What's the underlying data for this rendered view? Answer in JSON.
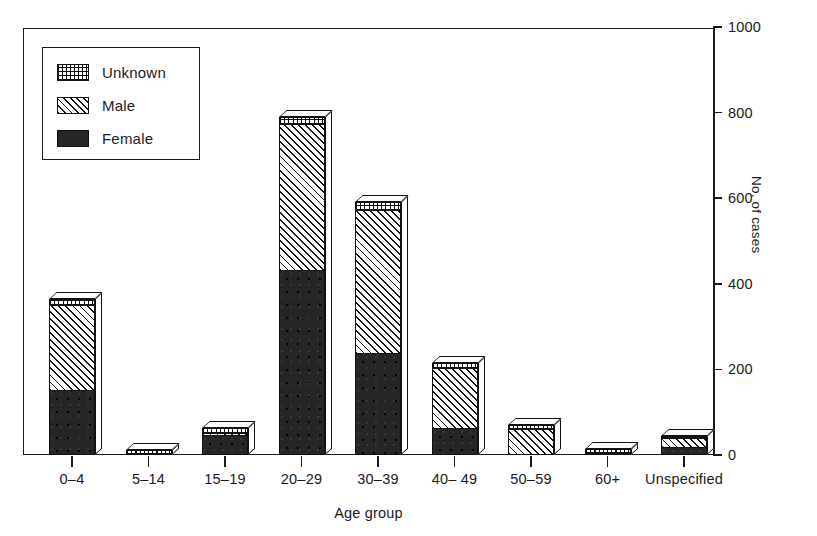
{
  "chart_data": {
    "type": "bar",
    "subtype": "stacked-bar-3d",
    "title": "",
    "xlabel": "Age group",
    "ylabel": "No. of cases",
    "categories": [
      "0–4",
      "5–14",
      "15–19",
      "20–29",
      "30–39",
      "40– 49",
      "50–59",
      "60+",
      "Unspecified"
    ],
    "series": [
      {
        "name": "Female",
        "pattern": "solid-black",
        "values": [
          155,
          2,
          48,
          435,
          240,
          65,
          4,
          2,
          22
        ]
      },
      {
        "name": "Male",
        "pattern": "diagonal-hatch",
        "values": [
          198,
          3,
          5,
          340,
          335,
          140,
          60,
          4,
          20
        ]
      },
      {
        "name": "Unknown",
        "pattern": "dotted-grid",
        "values": [
          12,
          7,
          9,
          15,
          15,
          10,
          6,
          9,
          3
        ]
      }
    ],
    "totals": [
      365,
      12,
      62,
      790,
      590,
      215,
      70,
      15,
      45
    ],
    "ylim": [
      0,
      1000
    ],
    "yticks": [
      0,
      200,
      400,
      600,
      800,
      1000
    ],
    "ytick_labels": [
      "0",
      "200",
      "400",
      "600",
      "800",
      "1000"
    ],
    "y_axis_position": "right",
    "grid": false,
    "legend_position": "top-left",
    "legend_entries": [
      "Unknown",
      "Male",
      "Female"
    ]
  },
  "legend": {
    "items": [
      {
        "label": "Unknown",
        "swatch": "unknown"
      },
      {
        "label": "Male",
        "swatch": "male"
      },
      {
        "label": "Female",
        "swatch": "female"
      }
    ]
  },
  "axes": {
    "y": {
      "title": "No. of cases",
      "ticks": [
        "1000",
        "800",
        "600",
        "400",
        "200",
        "0"
      ]
    },
    "x": {
      "title": "Age group",
      "ticks": [
        "0–4",
        "5–14",
        "15–19",
        "20–29",
        "30–39",
        "40– 49",
        "50–59",
        "60+",
        "Unspecified"
      ]
    }
  },
  "colors": {
    "ink": "#1a1a1a",
    "female_fill": "#262626",
    "background": "#ffffff"
  }
}
